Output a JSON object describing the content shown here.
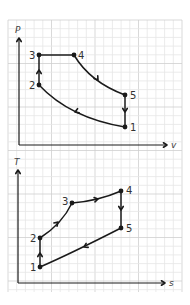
{
  "paper": {
    "grid": {
      "x0": 8,
      "y0": 20,
      "x1": 182,
      "y1": 292,
      "cell": 8.7,
      "minor_color": "#e6e6e6",
      "major_color": "#cfcfcf"
    },
    "background": "#ffffff",
    "ink": "#1a1a1a"
  },
  "pv_diagram": {
    "title": "P-v diagram",
    "y_axis_label": "P",
    "x_axis_label": "v",
    "axes": {
      "origin": [
        19,
        145
      ],
      "y_tip": [
        19,
        38
      ],
      "x_tip": [
        167,
        145
      ]
    },
    "points": [
      {
        "id": "1",
        "label": "1",
        "x": 125,
        "y": 127,
        "label_dx": 5,
        "label_dy": 4
      },
      {
        "id": "2",
        "label": "2",
        "x": 39,
        "y": 85,
        "label_dx": -10,
        "label_dy": 4
      },
      {
        "id": "3",
        "label": "3",
        "x": 39,
        "y": 55,
        "label_dx": -10,
        "label_dy": 4
      },
      {
        "id": "4",
        "label": "4",
        "x": 74,
        "y": 55,
        "label_dx": 4,
        "label_dy": 4
      },
      {
        "id": "5",
        "label": "5",
        "x": 125,
        "y": 95,
        "label_dx": 5,
        "label_dy": 4
      }
    ],
    "processes": [
      {
        "from": "1",
        "to": "2",
        "shape": "curve",
        "ctrl": [
          70,
          118
        ],
        "arrow_at": [
          75,
          112
        ],
        "arrow_dir": "left"
      },
      {
        "from": "2",
        "to": "3",
        "shape": "line",
        "arrow_at": [
          39,
          70
        ],
        "arrow_dir": "up"
      },
      {
        "from": "3",
        "to": "4",
        "shape": "line",
        "arrow_at": null
      },
      {
        "from": "4",
        "to": "5",
        "shape": "curve",
        "ctrl": [
          90,
          82
        ],
        "arrow_at": [
          98,
          80
        ],
        "arrow_dir": "down-right"
      },
      {
        "from": "5",
        "to": "1",
        "shape": "line",
        "arrow_at": [
          125,
          112
        ],
        "arrow_dir": "down"
      }
    ]
  },
  "ts_diagram": {
    "title": "T-s diagram",
    "y_axis_label": "T",
    "x_axis_label": "s",
    "axes": {
      "origin": [
        18,
        283
      ],
      "y_tip": [
        18,
        170
      ],
      "x_tip": [
        165,
        283
      ]
    },
    "points": [
      {
        "id": "1",
        "label": "1",
        "x": 40,
        "y": 267,
        "label_dx": -10,
        "label_dy": 4
      },
      {
        "id": "2",
        "label": "2",
        "x": 40,
        "y": 238,
        "label_dx": -10,
        "label_dy": 4
      },
      {
        "id": "3",
        "label": "3",
        "x": 72,
        "y": 203,
        "label_dx": -10,
        "label_dy": 2
      },
      {
        "id": "4",
        "label": "4",
        "x": 121,
        "y": 191,
        "label_dx": 5,
        "label_dy": 3
      },
      {
        "id": "5",
        "label": "5",
        "x": 121,
        "y": 228,
        "label_dx": 5,
        "label_dy": 4
      }
    ],
    "processes": [
      {
        "from": "1",
        "to": "2",
        "shape": "line",
        "arrow_at": [
          40,
          253
        ],
        "arrow_dir": "up"
      },
      {
        "from": "2",
        "to": "3",
        "shape": "curve",
        "ctrl": [
          62,
          224
        ],
        "arrow_at": [
          58,
          222
        ],
        "arrow_dir": "up-right"
      },
      {
        "from": "3",
        "to": "4",
        "shape": "curve",
        "ctrl": [
          98,
          201
        ],
        "arrow_at": [
          98,
          199
        ],
        "arrow_dir": "right"
      },
      {
        "from": "4",
        "to": "5",
        "shape": "line",
        "arrow_at": [
          121,
          210
        ],
        "arrow_dir": "down"
      },
      {
        "from": "5",
        "to": "1",
        "shape": "curve",
        "ctrl": [
          70,
          254
        ],
        "arrow_at": [
          84,
          247
        ],
        "arrow_dir": "down-left"
      }
    ]
  }
}
